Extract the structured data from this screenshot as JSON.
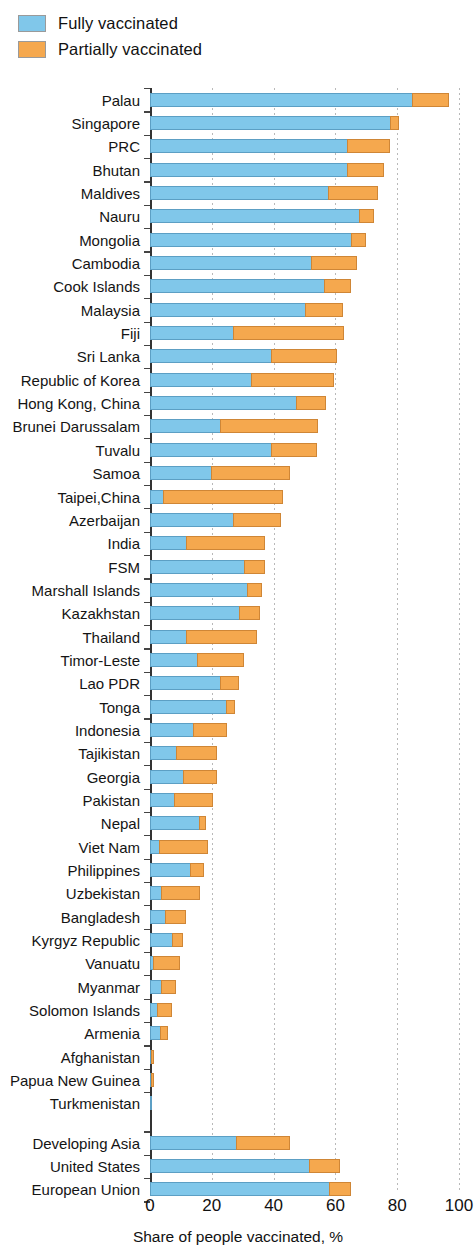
{
  "legend": {
    "position": "top-left",
    "items": [
      {
        "label": "Fully vaccinated",
        "color": "#80c7ea",
        "key": "fully"
      },
      {
        "label": "Partially vaccinated",
        "color": "#f5a84e",
        "key": "partially"
      }
    ]
  },
  "axis": {
    "x_title": "Share of people vaccinated, %",
    "x_ticks": [
      0,
      20,
      40,
      60,
      80,
      100
    ],
    "x_tick_labels": [
      "0",
      "20",
      "40",
      "60",
      "80",
      "100"
    ],
    "xlim": [
      0,
      100
    ],
    "grid": "vertical-dotted"
  },
  "chart_data": {
    "type": "bar",
    "orientation": "horizontal",
    "stacked": true,
    "title": "",
    "subtitle": "",
    "xlabel": "Share of people vaccinated, %",
    "ylabel": "",
    "xlim": [
      0,
      100
    ],
    "grid": true,
    "legend_position": "top-left",
    "series": [
      {
        "name": "Fully vaccinated",
        "color": "#80c7ea"
      },
      {
        "name": "Partially vaccinated",
        "color": "#f5a84e"
      }
    ],
    "categories": [
      "Palau",
      "Singapore",
      "PRC",
      "Bhutan",
      "Maldives",
      "Nauru",
      "Mongolia",
      "Cambodia",
      "Cook Islands",
      "Malaysia",
      "Fiji",
      "Sri Lanka",
      "Republic of Korea",
      "Hong Kong, China",
      "Brunei Darussalam",
      "Tuvalu",
      "Samoa",
      "Taipei,China",
      "Azerbaijan",
      "India",
      "FSM",
      "Marshall Islands",
      "Kazakhstan",
      "Thailand",
      "Timor-Leste",
      "Lao PDR",
      "Tonga",
      "Indonesia",
      "Tajikistan",
      "Georgia",
      "Pakistan",
      "Nepal",
      "Viet Nam",
      "Philippines",
      "Uzbekistan",
      "Bangladesh",
      "Kyrgyz Republic",
      "Vanuatu",
      "Myanmar",
      "Solomon Islands",
      "Armenia",
      "Afghanistan",
      "Papua New Guinea",
      "Turkmenistan",
      "Developing Asia",
      "United States",
      "European Union"
    ],
    "rows": [
      {
        "category": "Palau",
        "fully": 85.2,
        "partially": 11.9,
        "total": 97.1,
        "group": "economy"
      },
      {
        "category": "Singapore",
        "fully": 78.0,
        "partially": 2.9,
        "total": 80.9,
        "group": "economy"
      },
      {
        "category": "PRC",
        "fully": 64.2,
        "partially": 13.8,
        "total": 78.0,
        "group": "economy"
      },
      {
        "category": "Bhutan",
        "fully": 64.0,
        "partially": 12.1,
        "total": 76.1,
        "group": "economy"
      },
      {
        "category": "Maldives",
        "fully": 58.0,
        "partially": 16.0,
        "total": 74.0,
        "group": "economy"
      },
      {
        "category": "Nauru",
        "fully": 68.0,
        "partially": 4.8,
        "total": 72.8,
        "group": "economy"
      },
      {
        "category": "Mongolia",
        "fully": 65.5,
        "partially": 4.6,
        "total": 70.1,
        "group": "economy"
      },
      {
        "category": "Cambodia",
        "fully": 52.5,
        "partially": 14.7,
        "total": 67.2,
        "group": "economy"
      },
      {
        "category": "Cook Islands",
        "fully": 56.6,
        "partially": 8.7,
        "total": 65.3,
        "group": "economy"
      },
      {
        "category": "Malaysia",
        "fully": 50.5,
        "partially": 12.4,
        "total": 62.9,
        "group": "economy"
      },
      {
        "category": "Fiji",
        "fully": 27.3,
        "partially": 35.8,
        "total": 63.1,
        "group": "economy"
      },
      {
        "category": "Sri Lanka",
        "fully": 39.6,
        "partially": 21.1,
        "total": 60.7,
        "group": "economy"
      },
      {
        "category": "Republic of Korea",
        "fully": 32.9,
        "partially": 27.0,
        "total": 59.9,
        "group": "economy"
      },
      {
        "category": "Hong Kong, China",
        "fully": 47.5,
        "partially": 9.7,
        "total": 57.2,
        "group": "economy"
      },
      {
        "category": "Brunei Darussalam",
        "fully": 23.0,
        "partially": 31.8,
        "total": 54.8,
        "group": "economy"
      },
      {
        "category": "Tuvalu",
        "fully": 39.4,
        "partially": 14.9,
        "total": 54.3,
        "group": "economy"
      },
      {
        "category": "Samoa",
        "fully": 20.0,
        "partially": 25.5,
        "total": 45.5,
        "group": "economy"
      },
      {
        "category": "Taipei,China",
        "fully": 4.6,
        "partially": 38.9,
        "total": 43.5,
        "group": "economy"
      },
      {
        "category": "Azerbaijan",
        "fully": 27.3,
        "partially": 15.3,
        "total": 42.6,
        "group": "economy"
      },
      {
        "category": "India",
        "fully": 11.9,
        "partially": 25.5,
        "total": 37.4,
        "group": "economy"
      },
      {
        "category": "FSM",
        "fully": 30.7,
        "partially": 6.8,
        "total": 37.5,
        "group": "economy"
      },
      {
        "category": "Marshall Islands",
        "fully": 31.8,
        "partially": 4.9,
        "total": 36.7,
        "group": "economy"
      },
      {
        "category": "Kazakhstan",
        "fully": 29.1,
        "partially": 6.8,
        "total": 35.9,
        "group": "economy"
      },
      {
        "category": "Thailand",
        "fully": 11.9,
        "partially": 23.0,
        "total": 34.9,
        "group": "economy"
      },
      {
        "category": "Timor-Leste",
        "fully": 15.4,
        "partially": 15.3,
        "total": 30.7,
        "group": "economy"
      },
      {
        "category": "Lao PDR",
        "fully": 23.0,
        "partially": 6.1,
        "total": 29.1,
        "group": "economy"
      },
      {
        "category": "Tonga",
        "fully": 24.8,
        "partially": 2.9,
        "total": 27.7,
        "group": "economy"
      },
      {
        "category": "Indonesia",
        "fully": 14.3,
        "partially": 10.8,
        "total": 25.1,
        "group": "economy"
      },
      {
        "category": "Tajikistan",
        "fully": 8.6,
        "partially": 13.3,
        "total": 21.9,
        "group": "economy"
      },
      {
        "category": "Georgia",
        "fully": 11.1,
        "partially": 10.8,
        "total": 21.9,
        "group": "economy"
      },
      {
        "category": "Pakistan",
        "fully": 8.1,
        "partially": 12.7,
        "total": 20.8,
        "group": "economy"
      },
      {
        "category": "Nepal",
        "fully": 16.2,
        "partially": 2.1,
        "total": 18.3,
        "group": "economy"
      },
      {
        "category": "Viet Nam",
        "fully": 3.2,
        "partially": 15.9,
        "total": 19.1,
        "group": "economy"
      },
      {
        "category": "Philippines",
        "fully": 13.3,
        "partially": 4.5,
        "total": 17.8,
        "group": "economy"
      },
      {
        "category": "Uzbekistan",
        "fully": 4.0,
        "partially": 12.4,
        "total": 16.4,
        "group": "economy"
      },
      {
        "category": "Bangladesh",
        "fully": 5.1,
        "partially": 6.8,
        "total": 11.9,
        "group": "economy"
      },
      {
        "category": "Kyrgyz Republic",
        "fully": 7.5,
        "partially": 3.6,
        "total": 11.1,
        "group": "economy"
      },
      {
        "category": "Vanuatu",
        "fully": 1.4,
        "partially": 8.6,
        "total": 10.0,
        "group": "economy"
      },
      {
        "category": "Myanmar",
        "fully": 3.8,
        "partially": 4.8,
        "total": 8.6,
        "group": "economy"
      },
      {
        "category": "Solomon Islands",
        "fully": 2.5,
        "partially": 5.0,
        "total": 7.5,
        "group": "economy"
      },
      {
        "category": "Armenia",
        "fully": 3.6,
        "partially": 2.5,
        "total": 6.1,
        "group": "economy"
      },
      {
        "category": "Afghanistan",
        "fully": 0.6,
        "partially": 1.0,
        "total": 1.6,
        "group": "economy"
      },
      {
        "category": "Papua New Guinea",
        "fully": 0.2,
        "partially": 1.1,
        "total": 1.3,
        "group": "economy"
      },
      {
        "category": "Turkmenistan",
        "fully": 0.2,
        "partially": 0.0,
        "total": 0.2,
        "group": "economy"
      },
      {
        "category": "Developing Asia",
        "fully": 28.0,
        "partially": 17.6,
        "total": 45.6,
        "group": "aggregate"
      },
      {
        "category": "United States",
        "fully": 51.8,
        "partially": 10.0,
        "total": 61.8,
        "group": "aggregate"
      },
      {
        "category": "European Union",
        "fully": 58.3,
        "partially": 7.2,
        "total": 65.5,
        "group": "aggregate"
      }
    ]
  }
}
